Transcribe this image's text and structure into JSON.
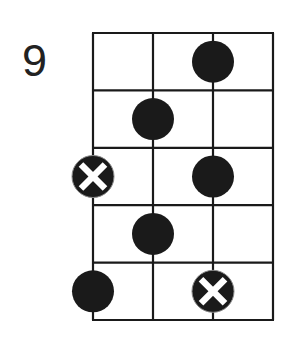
{
  "diagram": {
    "type": "fretboard-scale-pattern",
    "start_fret_label": "9",
    "strings": 4,
    "frets_shown": 5,
    "colors": {
      "line": "#1a1a1a",
      "dot": "#1a1a1a",
      "root_mark": "#ffffff",
      "background": "#ffffff",
      "label": "#222222"
    },
    "notes": [
      {
        "fret": 1,
        "string": 3,
        "kind": "dot"
      },
      {
        "fret": 2,
        "string": 2,
        "kind": "dot"
      },
      {
        "fret": 3,
        "string": 1,
        "kind": "root-x"
      },
      {
        "fret": 3,
        "string": 3,
        "kind": "dot"
      },
      {
        "fret": 4,
        "string": 2,
        "kind": "dot"
      },
      {
        "fret": 5,
        "string": 1,
        "kind": "dot"
      },
      {
        "fret": 5,
        "string": 3,
        "kind": "root-x"
      }
    ]
  }
}
